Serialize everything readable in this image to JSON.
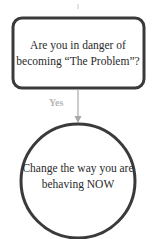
{
  "diagram": {
    "decision": {
      "text": "Are you in danger of becoming “The Problem”?"
    },
    "edge": {
      "label": "Yes"
    },
    "outcome": {
      "text": "Change the way you are behaving NOW"
    },
    "colors": {
      "stroke": "#3a3a3a",
      "arrow": "#a8a8a8",
      "label": "#b8b8b8"
    }
  }
}
